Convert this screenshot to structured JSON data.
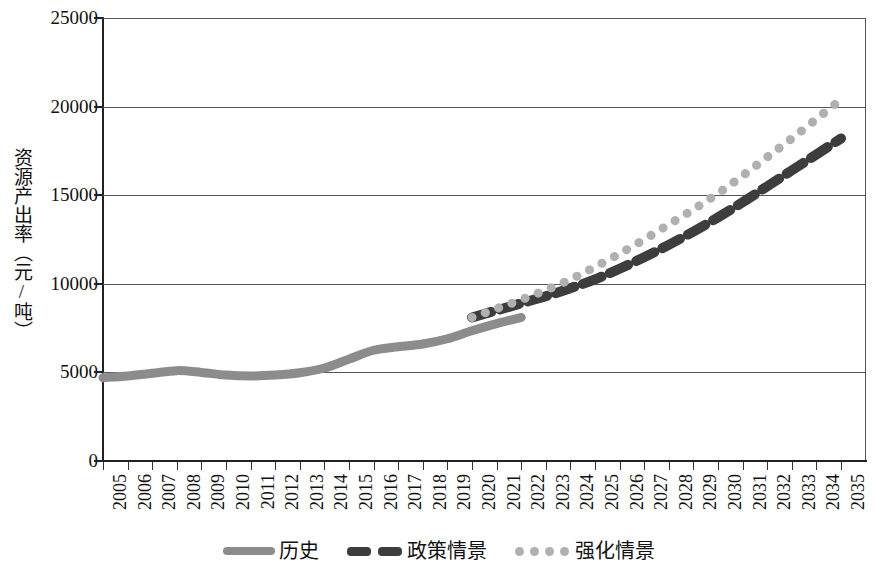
{
  "chart_data": {
    "type": "line",
    "title": "",
    "xlabel": "",
    "ylabel": "资源产出率（元/吨）",
    "ylim": [
      0,
      25000
    ],
    "ytick_labels": [
      "25000",
      "20000",
      "15000",
      "10000",
      "5000",
      "0"
    ],
    "ytick_values": [
      25000,
      20000,
      15000,
      10000,
      5000,
      0
    ],
    "grid": true,
    "legend_position": "bottom",
    "x": [
      2005,
      2006,
      2007,
      2008,
      2009,
      2010,
      2011,
      2012,
      2013,
      2014,
      2015,
      2016,
      2017,
      2018,
      2019,
      2020,
      2021,
      2022,
      2023,
      2024,
      2025,
      2026,
      2027,
      2028,
      2029,
      2030,
      2031,
      2032,
      2033,
      2034,
      2035
    ],
    "categories": [
      "2005",
      "2006",
      "2007",
      "2008",
      "2009",
      "2010",
      "2011",
      "2012",
      "2013",
      "2014",
      "2015",
      "2016",
      "2017",
      "2018",
      "2019",
      "2020",
      "2021",
      "2022",
      "2023",
      "2024",
      "2025",
      "2026",
      "2027",
      "2028",
      "2029",
      "2030",
      "2031",
      "2032",
      "2033",
      "2034",
      "2035"
    ],
    "series": [
      {
        "name": "历史",
        "style": "solid",
        "color": "#8c8c8c",
        "values": [
          4700,
          4800,
          4950,
          5100,
          5000,
          4850,
          4800,
          4850,
          4980,
          5250,
          5750,
          6250,
          6450,
          6600,
          6900,
          7350,
          7750,
          8100,
          null,
          null,
          null,
          null,
          null,
          null,
          null,
          null,
          null,
          null,
          null,
          null,
          null
        ]
      },
      {
        "name": "政策情景",
        "style": "dashed",
        "color": "#3d3d3d",
        "values": [
          null,
          null,
          null,
          null,
          null,
          null,
          null,
          null,
          null,
          null,
          null,
          null,
          null,
          null,
          null,
          8100,
          8500,
          8900,
          9300,
          9750,
          10250,
          10850,
          11500,
          12200,
          12950,
          13750,
          14600,
          15500,
          16400,
          17300,
          18200
        ]
      },
      {
        "name": "强化情景",
        "style": "dotted",
        "color": "#b0b0b0",
        "values": [
          null,
          null,
          null,
          null,
          null,
          null,
          null,
          null,
          null,
          null,
          null,
          null,
          null,
          null,
          null,
          8100,
          8600,
          9100,
          9650,
          10250,
          10950,
          11700,
          12500,
          13350,
          14200,
          15100,
          16100,
          17150,
          18200,
          19300,
          20400
        ]
      }
    ]
  },
  "axis": {
    "y_title": "资源产出率（元/吨）",
    "y_ticks": [
      "25000",
      "20000",
      "15000",
      "10000",
      "5000",
      "0"
    ],
    "x_ticks": [
      "2005",
      "2006",
      "2007",
      "2008",
      "2009",
      "2010",
      "2011",
      "2012",
      "2013",
      "2014",
      "2015",
      "2016",
      "2017",
      "2018",
      "2019",
      "2020",
      "2021",
      "2022",
      "2023",
      "2024",
      "2025",
      "2026",
      "2027",
      "2028",
      "2029",
      "2030",
      "2031",
      "2032",
      "2033",
      "2034",
      "2035"
    ]
  },
  "legend": {
    "items": [
      {
        "label": "历史",
        "style": "solid",
        "color": "#8c8c8c"
      },
      {
        "label": "政策情景",
        "style": "dashed",
        "color": "#3d3d3d"
      },
      {
        "label": "强化情景",
        "style": "dotted",
        "color": "#b0b0b0"
      }
    ]
  },
  "colors": {
    "historical": "#8c8c8c",
    "policy": "#3d3d3d",
    "enhanced": "#b0b0b0",
    "axis": "#222222",
    "gridline": "#555555",
    "background": "#ffffff"
  }
}
